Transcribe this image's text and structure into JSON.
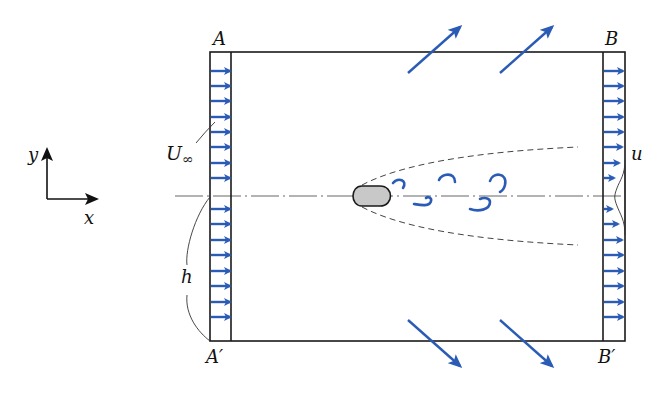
{
  "figure": {
    "type": "control-volume flow diagram",
    "colors": {
      "flow_arrows": "#2a5bb5",
      "lines": "#1a1a1a",
      "body_fill": "#c8c8c8",
      "background": "#ffffff"
    }
  },
  "labels": {
    "corner_A": "A",
    "corner_B": "B",
    "corner_A_prime": "A′",
    "corner_B_prime": "B′",
    "inflow_velocity": "U",
    "inflow_velocity_subscript": "∞",
    "outflow_velocity": "u",
    "height": "h",
    "axis_x": "x",
    "axis_y": "y"
  },
  "control_volume": {
    "left": 210,
    "right": 625,
    "top": 52,
    "bottom": 341,
    "inlet_strip_width": 21,
    "outlet_strip_width": 22,
    "centerline_y": 196
  },
  "inlet_arrows": {
    "count_upper": 8,
    "count_lower": 8,
    "y_positions": [
      71,
      86,
      101,
      117,
      132,
      147,
      163,
      178,
      209,
      224,
      240,
      255,
      271,
      286,
      302,
      317
    ],
    "length": 21
  },
  "outlet_arrows": {
    "y_positions": [
      71,
      86,
      101,
      117,
      132,
      147,
      163,
      178,
      209,
      224,
      240,
      255,
      271,
      286,
      302,
      317
    ],
    "lengths": [
      21,
      21,
      21,
      21,
      21,
      20,
      17,
      12,
      10,
      16,
      20,
      21,
      21,
      21,
      21,
      21
    ]
  },
  "side_outflow_arrows": {
    "top": [
      {
        "x1": 408,
        "y1": 73,
        "x2": 460,
        "y2": 27
      },
      {
        "x1": 500,
        "y1": 73,
        "x2": 552,
        "y2": 27
      }
    ],
    "bottom": [
      {
        "x1": 408,
        "y1": 320,
        "x2": 460,
        "y2": 366
      },
      {
        "x1": 500,
        "y1": 320,
        "x2": 552,
        "y2": 366
      }
    ]
  },
  "wake": {
    "eddy_count": 6
  }
}
